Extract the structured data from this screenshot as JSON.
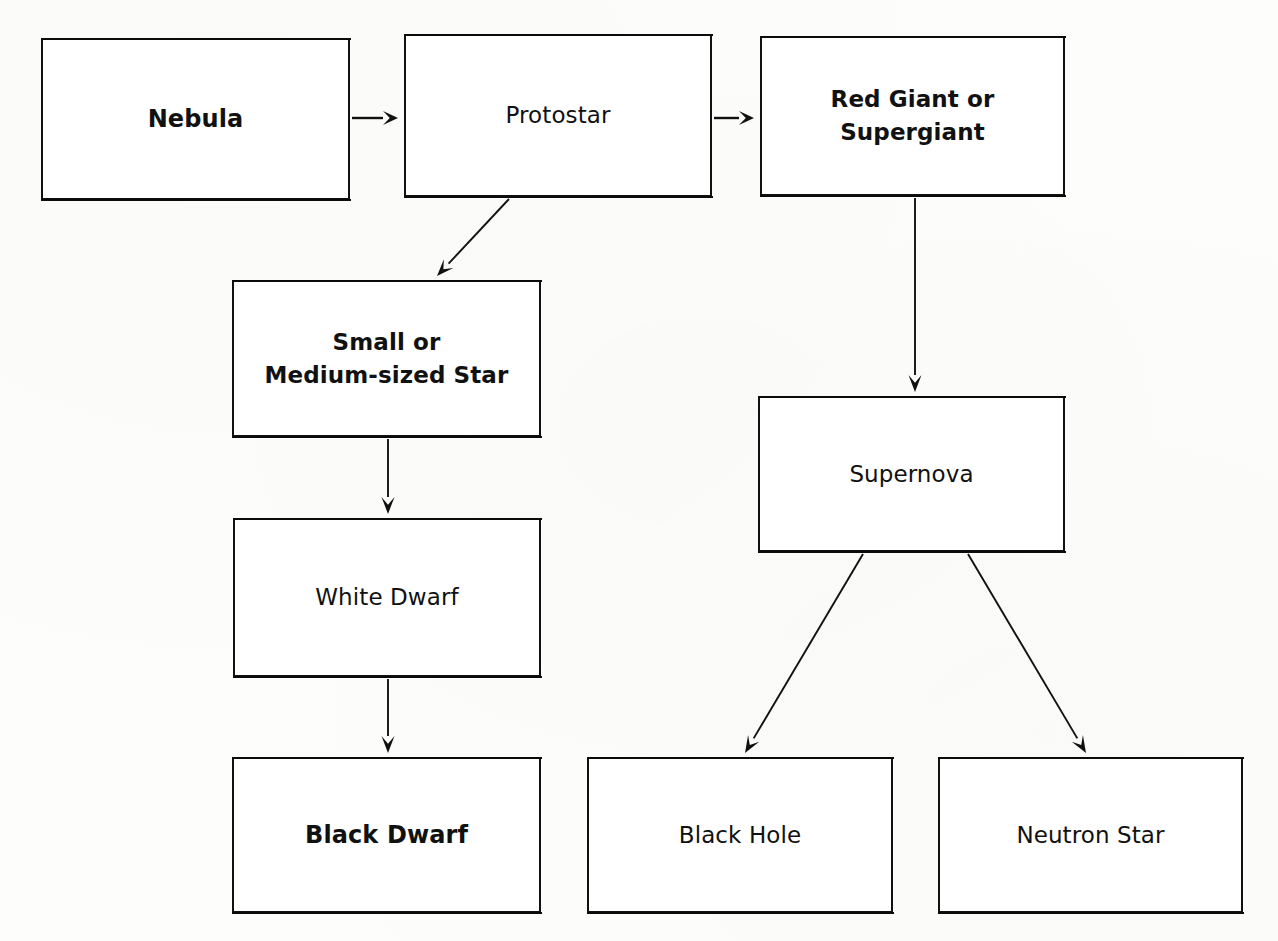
{
  "diagram": {
    "type": "flowchart",
    "background_color": "#fdfdfc",
    "line_color": "#111111",
    "text_color": "#111111",
    "nodes": [
      {
        "id": "nebula",
        "label": "Nebula",
        "weight": "bold",
        "font_size": 24,
        "x": 41,
        "y": 38,
        "w": 309,
        "h": 162
      },
      {
        "id": "protostar",
        "label": "Protostar",
        "weight": "normal",
        "font_size": 23,
        "x": 404,
        "y": 34,
        "w": 308,
        "h": 163
      },
      {
        "id": "red-giant",
        "label": "Red Giant or\nSupergiant",
        "weight": "bold",
        "font_size": 23,
        "x": 760,
        "y": 36,
        "w": 305,
        "h": 160
      },
      {
        "id": "small-medium-star",
        "label": "Small or\nMedium-sized Star",
        "weight": "bold",
        "font_size": 23,
        "x": 232,
        "y": 280,
        "w": 309,
        "h": 157
      },
      {
        "id": "supernova",
        "label": "Supernova",
        "weight": "normal",
        "font_size": 23,
        "x": 758,
        "y": 396,
        "w": 307,
        "h": 156
      },
      {
        "id": "white-dwarf",
        "label": "White Dwarf",
        "weight": "normal",
        "font_size": 23,
        "x": 233,
        "y": 518,
        "w": 308,
        "h": 159
      },
      {
        "id": "black-dwarf",
        "label": "Black Dwarf",
        "weight": "bold",
        "font_size": 24,
        "x": 232,
        "y": 757,
        "w": 309,
        "h": 156
      },
      {
        "id": "black-hole",
        "label": "Black Hole",
        "weight": "normal",
        "font_size": 23,
        "x": 587,
        "y": 757,
        "w": 306,
        "h": 156
      },
      {
        "id": "neutron-star",
        "label": "Neutron Star",
        "weight": "normal",
        "font_size": 23,
        "x": 938,
        "y": 757,
        "w": 305,
        "h": 156
      }
    ],
    "edges": [
      {
        "id": "nebula-to-protostar",
        "from": "nebula",
        "to": "protostar",
        "kind": "horizontal",
        "x1": 352,
        "y1": 118,
        "x2": 398,
        "y2": 118
      },
      {
        "id": "protostar-to-red-giant",
        "from": "protostar",
        "to": "red-giant",
        "kind": "horizontal",
        "x1": 714,
        "y1": 118,
        "x2": 754,
        "y2": 118
      },
      {
        "id": "protostar-to-small-star",
        "from": "protostar",
        "to": "small-medium-star",
        "kind": "diagonal",
        "x1": 509,
        "y1": 199,
        "x2": 437,
        "y2": 276
      },
      {
        "id": "red-giant-to-supernova",
        "from": "red-giant",
        "to": "supernova",
        "kind": "vertical",
        "x1": 915,
        "y1": 198,
        "x2": 915,
        "y2": 392
      },
      {
        "id": "small-star-to-white-dwarf",
        "from": "small-medium-star",
        "to": "white-dwarf",
        "kind": "vertical",
        "x1": 388,
        "y1": 439,
        "x2": 388,
        "y2": 514
      },
      {
        "id": "white-dwarf-to-black-dwarf",
        "from": "white-dwarf",
        "to": "black-dwarf",
        "kind": "vertical",
        "x1": 388,
        "y1": 679,
        "x2": 388,
        "y2": 753
      },
      {
        "id": "supernova-to-black-hole",
        "from": "supernova",
        "to": "black-hole",
        "kind": "diagonal",
        "x1": 863,
        "y1": 554,
        "x2": 745,
        "y2": 753
      },
      {
        "id": "supernova-to-neutron-star",
        "from": "supernova",
        "to": "neutron-star",
        "kind": "diagonal",
        "x1": 968,
        "y1": 554,
        "x2": 1086,
        "y2": 753
      }
    ]
  }
}
